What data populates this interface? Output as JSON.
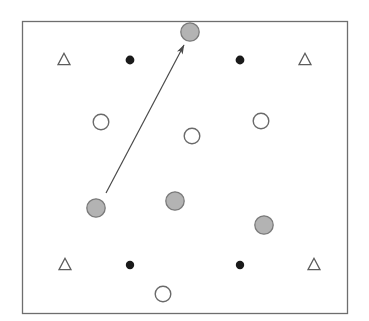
{
  "figure": {
    "canvas": {
      "width": 369,
      "height": 321,
      "background": "#ffffff"
    },
    "frame": {
      "name": "plot-border",
      "x": 22,
      "y": 21,
      "width": 325,
      "height": 292,
      "stroke": "#6e6e6e",
      "stroke_width": 1.3,
      "fill": "#ffffff"
    },
    "styles": {
      "gray_marker_fill": "#b3b3b3",
      "gray_marker_stroke": "#7a7a7a",
      "white_marker_fill": "#ffffff",
      "white_marker_stroke": "#6a6a6a",
      "black_marker_fill": "#1a1a1a",
      "triangle_stroke": "#5d5d5d",
      "arrow_stroke": "#4a4a4a",
      "arrow_width": 1.2
    },
    "markers": [
      {
        "id": "triangle-top-left",
        "shape": "triangle",
        "cx": 64,
        "cy": 59,
        "size": 12
      },
      {
        "id": "triangle-top-right",
        "shape": "triangle",
        "cx": 305,
        "cy": 59,
        "size": 12
      },
      {
        "id": "triangle-bottom-left",
        "shape": "triangle",
        "cx": 65,
        "cy": 264,
        "size": 12
      },
      {
        "id": "triangle-bottom-right",
        "shape": "triangle",
        "cx": 314,
        "cy": 264,
        "size": 12
      },
      {
        "id": "dot-top-left",
        "shape": "filled-circle",
        "cx": 130,
        "cy": 60,
        "r": 4.4
      },
      {
        "id": "dot-top-right",
        "shape": "filled-circle",
        "cx": 240,
        "cy": 60,
        "r": 4.4
      },
      {
        "id": "dot-bottom-left",
        "shape": "filled-circle",
        "cx": 130,
        "cy": 265,
        "r": 4.2
      },
      {
        "id": "dot-bottom-right",
        "shape": "filled-circle",
        "cx": 240,
        "cy": 265,
        "r": 4.2
      },
      {
        "id": "open-circle-left",
        "shape": "open-circle",
        "cx": 101,
        "cy": 122,
        "r": 7.8
      },
      {
        "id": "open-circle-center",
        "shape": "open-circle",
        "cx": 192,
        "cy": 136,
        "r": 7.8
      },
      {
        "id": "open-circle-right",
        "shape": "open-circle",
        "cx": 261,
        "cy": 121,
        "r": 7.8
      },
      {
        "id": "open-circle-bottom",
        "shape": "open-circle",
        "cx": 163,
        "cy": 294,
        "r": 7.8
      },
      {
        "id": "gray-circle-top",
        "shape": "gray-circle",
        "cx": 190,
        "cy": 32,
        "r": 9.2
      },
      {
        "id": "gray-circle-origin",
        "shape": "gray-circle",
        "cx": 96,
        "cy": 208,
        "r": 9.2
      },
      {
        "id": "gray-circle-middle",
        "shape": "gray-circle",
        "cx": 175,
        "cy": 201,
        "r": 9.2
      },
      {
        "id": "gray-circle-lower-right",
        "shape": "gray-circle",
        "cx": 264,
        "cy": 225,
        "r": 9.2
      }
    ],
    "arrow": {
      "id": "displacement-arrow",
      "from": {
        "x": 106,
        "y": 193
      },
      "to": {
        "x": 184,
        "y": 45
      },
      "head_length": 11,
      "head_width": 5
    }
  }
}
